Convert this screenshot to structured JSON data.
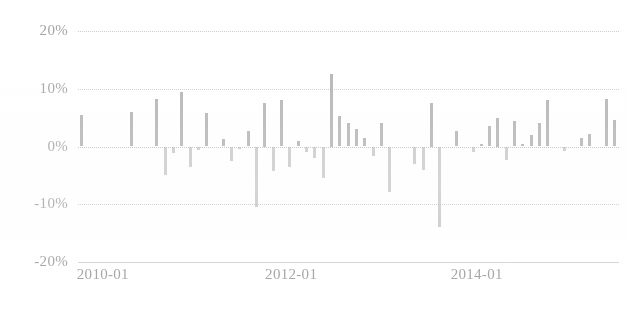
{
  "chart_data": {
    "type": "bar",
    "title": "",
    "subtitle": "",
    "xlabel": "",
    "ylabel": "",
    "ylim": [
      -20,
      20
    ],
    "ytick_labels": [
      "20%",
      "10%",
      "0%",
      "-10%",
      "-20%"
    ],
    "ytick_values": [
      20,
      10,
      0,
      -10,
      -20
    ],
    "xtick_labels": [
      "2010-01",
      "2012-01",
      "2014-01"
    ],
    "xtick_values": [
      "2010-01",
      "2012-01",
      "2014-01"
    ],
    "grid": true,
    "grid_axis": "y",
    "legend": "none",
    "bar_color": "#9e9e9e",
    "series_name": "",
    "x": [
      "2009-10",
      "2009-11",
      "2009-12",
      "2010-01",
      "2010-02",
      "2010-03",
      "2010-04",
      "2010-05",
      "2010-06",
      "2010-07",
      "2010-08",
      "2010-09",
      "2010-10",
      "2010-11",
      "2010-12",
      "2011-01",
      "2011-02",
      "2011-03",
      "2011-04",
      "2011-05",
      "2011-06",
      "2011-07",
      "2011-08",
      "2011-09",
      "2011-10",
      "2011-11",
      "2011-12",
      "2012-01",
      "2012-02",
      "2012-03",
      "2012-04",
      "2012-05",
      "2012-06",
      "2012-07",
      "2012-08",
      "2012-09",
      "2012-10",
      "2012-11",
      "2012-12",
      "2013-01",
      "2013-02",
      "2013-03",
      "2013-04",
      "2013-05",
      "2013-06",
      "2013-07",
      "2013-08",
      "2013-09",
      "2013-10",
      "2013-11",
      "2013-12",
      "2014-01",
      "2014-02",
      "2014-03",
      "2014-04",
      "2014-05",
      "2014-06",
      "2014-07",
      "2014-08",
      "2014-09",
      "2014-10",
      "2014-11",
      "2014-12",
      "2015-01",
      "2015-02"
    ],
    "values": [
      5.5,
      0.0,
      0.0,
      0.0,
      0.0,
      0.0,
      6.0,
      0.0,
      0.0,
      8.2,
      -5.0,
      -1.2,
      9.5,
      -3.5,
      -0.6,
      5.8,
      0.0,
      1.3,
      -2.5,
      -0.5,
      2.7,
      -10.5,
      7.5,
      -4.2,
      8.0,
      -3.5,
      1.0,
      -1.0,
      -2.0,
      -5.5,
      12.5,
      5.3,
      4.0,
      3.0,
      1.5,
      -1.6,
      4.0,
      -7.8,
      0.0,
      0.0,
      -3.0,
      -4.0,
      7.5,
      -14.0,
      0.0,
      2.6,
      0.0,
      -1.0,
      0.4,
      3.5,
      5.0,
      -2.3,
      4.5,
      0.5,
      2.0,
      4.0,
      8.0,
      0.0,
      -0.8,
      0.0,
      1.5,
      2.2,
      0.0,
      8.3,
      4.6
    ]
  },
  "axis": {
    "y_ticks": [
      {
        "label": "20%",
        "value": 20
      },
      {
        "label": "10%",
        "value": 10
      },
      {
        "label": "0%",
        "value": 0
      },
      {
        "label": "-10%",
        "value": -10
      },
      {
        "label": "-20%",
        "value": -20
      }
    ],
    "x_ticks": [
      {
        "label": "2010-01",
        "pos_pct": 4.6
      },
      {
        "label": "2012-01",
        "pos_pct": 39.4
      },
      {
        "label": "2014-01",
        "pos_pct": 73.7
      }
    ]
  }
}
